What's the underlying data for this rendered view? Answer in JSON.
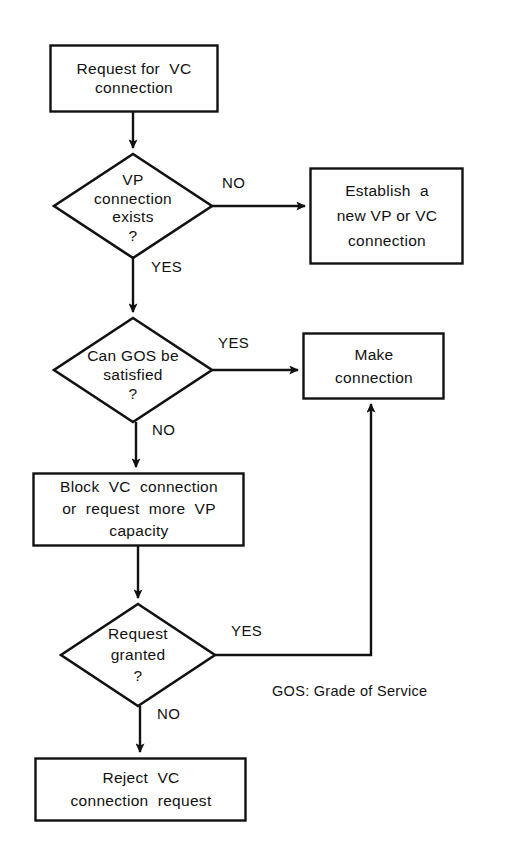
{
  "diagram": {
    "type": "flowchart",
    "background_color": "#ffffff",
    "stroke_color": "#111111",
    "text_color": "#111111",
    "nodes": [
      {
        "id": "request",
        "shape": "process",
        "lines": [
          "Request for  VC",
          "connection"
        ],
        "text": "Request for VC connection"
      },
      {
        "id": "vp_exists",
        "shape": "decision",
        "lines": [
          "VP",
          "connection",
          "exists",
          "?"
        ],
        "text": "VP connection exists ?"
      },
      {
        "id": "establish",
        "shape": "process",
        "lines": [
          "Establish  a",
          "new VP or VC",
          "connection"
        ],
        "text": "Establish a new VP or VC connection"
      },
      {
        "id": "gos",
        "shape": "decision",
        "lines": [
          "Can GOS be",
          "satisfied",
          "?"
        ],
        "text": "Can GOS be satisfied ?"
      },
      {
        "id": "make",
        "shape": "process",
        "lines": [
          "Make",
          "connection"
        ],
        "text": "Make connection"
      },
      {
        "id": "block",
        "shape": "process",
        "lines": [
          "Block  VC  connection",
          "or  request  more  VP",
          "capacity"
        ],
        "text": "Block VC connection or request more VP capacity"
      },
      {
        "id": "granted",
        "shape": "decision",
        "lines": [
          "Request",
          "granted",
          "?"
        ],
        "text": "Request granted ?"
      },
      {
        "id": "reject",
        "shape": "process",
        "lines": [
          "Reject  VC",
          "connection  request"
        ],
        "text": "Reject VC connection request"
      }
    ],
    "edge_labels": {
      "vp_exists_no": "NO",
      "vp_exists_yes": "YES",
      "gos_yes": "YES",
      "gos_no": "NO",
      "granted_yes": "YES",
      "granted_no": "NO"
    },
    "legend": "GOS: Grade of Service"
  }
}
